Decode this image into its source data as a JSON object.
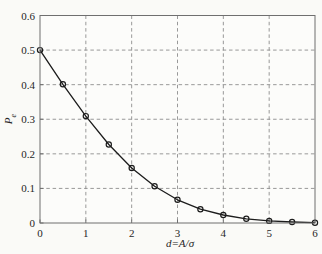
{
  "figure": {
    "background": "#fafaf7",
    "plot_background": "#fcfcfa",
    "box_color": "#6f6f6f",
    "grid_color": "#8d8d8d",
    "line_color": "#1c1c1c",
    "marker_color": "#1c1c1c",
    "text_color": "#262626"
  },
  "chart_data": {
    "type": "line",
    "title": "",
    "xlabel": "d=A/σ",
    "ylabel": "Pe",
    "ylabel_main": "P",
    "ylabel_sub": "e",
    "x": [
      0,
      0.5,
      1,
      1.5,
      2,
      2.5,
      3,
      3.5,
      4,
      4.5,
      5,
      5.5,
      6
    ],
    "y": [
      0.5,
      0.401,
      0.309,
      0.227,
      0.159,
      0.106,
      0.067,
      0.04,
      0.023,
      0.012,
      0.006,
      0.003,
      0.001
    ],
    "xlim": [
      0,
      6
    ],
    "ylim": [
      0,
      0.6
    ],
    "xticks": [
      0,
      1,
      2,
      3,
      4,
      5,
      6
    ],
    "xticklabels": [
      "0",
      "1",
      "2",
      "3",
      "4",
      "5",
      "6"
    ],
    "yticks": [
      0,
      0.1,
      0.2,
      0.3,
      0.4,
      0.5,
      0.6
    ],
    "yticklabels": [
      "0",
      "0.1",
      "0.2",
      "0.3",
      "0.4",
      "0.5",
      "0.6"
    ],
    "grid": "dashed",
    "marker": "circle",
    "legend": null
  }
}
